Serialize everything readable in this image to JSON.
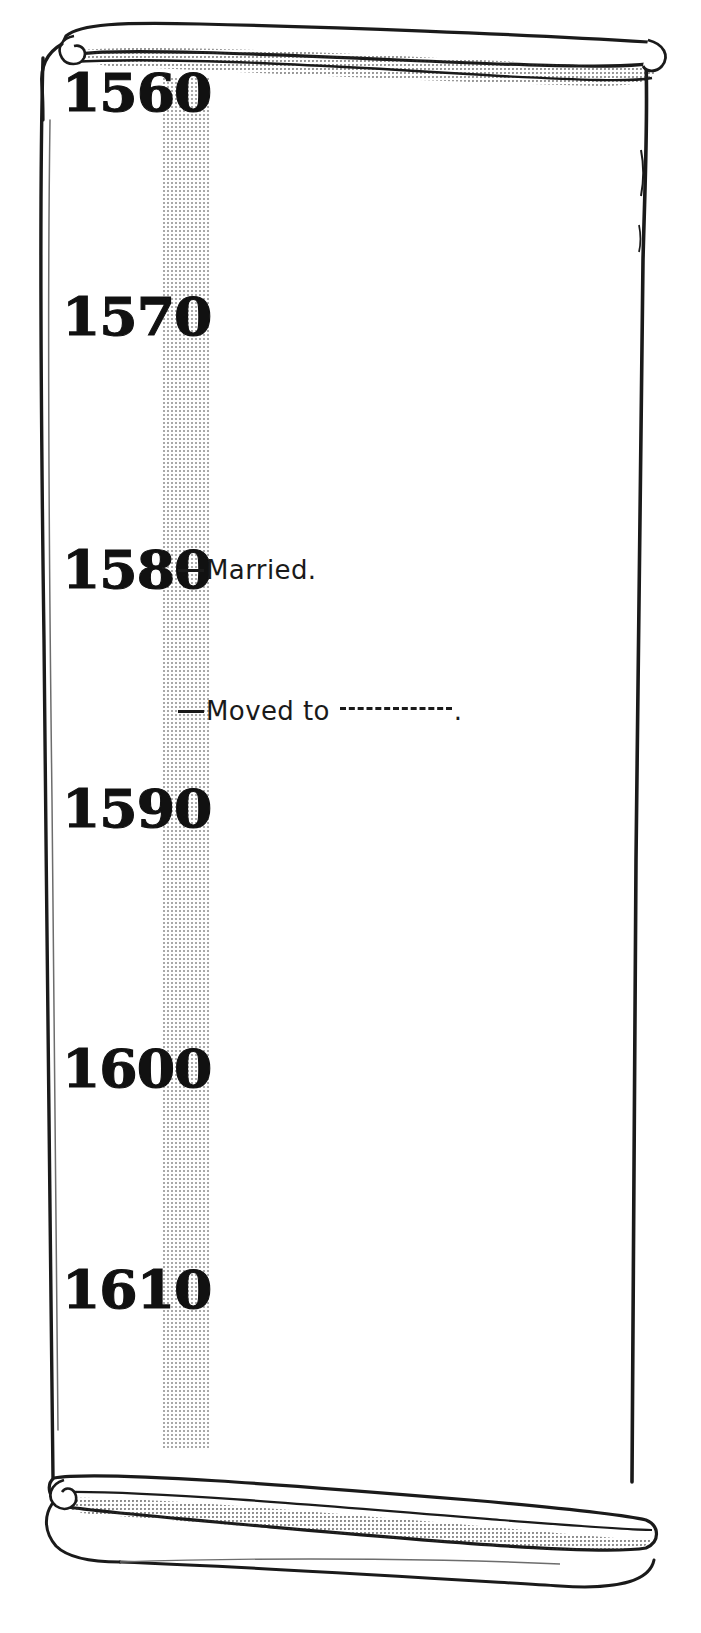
{
  "document": {
    "kind": "hand-drawn-scroll-timeline",
    "title": "",
    "paper_color": "#ffffff",
    "ink_color": "#1a1a1a",
    "band_color": "#9a9a9a"
  },
  "timeline": {
    "band_label": "timeline-band",
    "years": [
      {
        "label": "1560",
        "y": 66
      },
      {
        "label": "1570",
        "y": 290
      },
      {
        "label": "1580",
        "y": 543
      },
      {
        "label": "1590",
        "y": 782
      },
      {
        "label": "1600",
        "y": 1042
      },
      {
        "label": "1610",
        "y": 1263
      }
    ],
    "events": [
      {
        "id": "married",
        "text": "Married.",
        "blank": false,
        "trailing": "",
        "y": 555,
        "x": 178
      },
      {
        "id": "moved-to",
        "text": "Moved to",
        "blank": true,
        "trailing": ".",
        "y": 696,
        "x": 178
      }
    ]
  }
}
